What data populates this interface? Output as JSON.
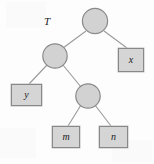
{
  "figure": {
    "title_label": "T",
    "background_color": "#fdfdfd",
    "node_fill": "#d2d2d2",
    "node_stroke": "#8a8a8a",
    "box_fill": "#d5d5d5",
    "box_stroke": "#888888",
    "edge_color": "#9a9a9a",
    "text_color": "#1a1a1a"
  },
  "tree": {
    "internal_nodes": [
      {
        "id": "root",
        "label": "",
        "cx": 95,
        "cy": 21,
        "r": 13
      },
      {
        "id": "left-internal",
        "label": "",
        "cx": 55,
        "cy": 56,
        "r": 12.5
      },
      {
        "id": "lower-internal",
        "label": "",
        "cx": 88,
        "cy": 96,
        "r": 12.5
      }
    ],
    "leaves": [
      {
        "id": "x",
        "label": "x",
        "x": 118,
        "y": 48,
        "w": 26,
        "h": 24
      },
      {
        "id": "y",
        "label": "y",
        "x": 11,
        "y": 84,
        "w": 31,
        "h": 22
      },
      {
        "id": "m",
        "label": "m",
        "x": 52,
        "y": 126,
        "w": 28,
        "h": 22
      },
      {
        "id": "n",
        "label": "n",
        "x": 99,
        "y": 126,
        "w": 29,
        "h": 22
      }
    ],
    "edges": [
      {
        "id": "root-to-left-internal",
        "x1": 86,
        "y1": 31,
        "x2": 63,
        "y2": 48
      },
      {
        "id": "root-to-x",
        "x1": 104,
        "y1": 31,
        "x2": 127,
        "y2": 48
      },
      {
        "id": "left-internal-to-y",
        "x1": 47,
        "y1": 65,
        "x2": 29,
        "y2": 84
      },
      {
        "id": "left-internal-to-lower-internal",
        "x1": 63,
        "y1": 65,
        "x2": 81,
        "y2": 87
      },
      {
        "id": "lower-internal-to-m",
        "x1": 81,
        "y1": 105,
        "x2": 68,
        "y2": 126
      },
      {
        "id": "lower-internal-to-n",
        "x1": 95,
        "y1": 105,
        "x2": 111,
        "y2": 126
      }
    ]
  },
  "annotations": {
    "tree_name": {
      "text": "T",
      "x": 44,
      "y": 16
    }
  }
}
